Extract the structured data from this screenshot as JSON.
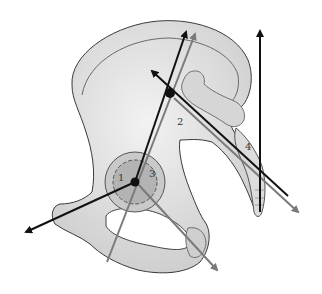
{
  "figure": {
    "labels": [
      {
        "id": "1",
        "text": "1",
        "x": 118,
        "y": 181
      },
      {
        "id": "2",
        "text": "2",
        "x": 177,
        "y": 125
      },
      {
        "id": "3",
        "text": "3",
        "x": 149,
        "y": 177
      },
      {
        "id": "4",
        "text": "4",
        "x": 245,
        "y": 150
      }
    ],
    "colors": {
      "bone_fill": "#e6e6e6",
      "bone_shade": "#c8c8c8",
      "acetabulum": "#b3b3b3",
      "outline": "#3a3a3a",
      "axis_black": "#111111",
      "axis_gray": "#7a7a7a"
    }
  }
}
